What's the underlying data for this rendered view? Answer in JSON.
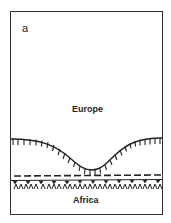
{
  "figure": {
    "panel_label": "a",
    "regions": {
      "upper": "Europe",
      "lower": "Africa"
    },
    "elements": [
      {
        "type": "hatched-curve",
        "description": "ticked boundary curve with downward ticks, dipping in the center"
      },
      {
        "type": "dashed-line",
        "description": "horizontal dashed line"
      },
      {
        "type": "solid-line-with-teeth",
        "description": "horizontal solid line with small downward triangles"
      },
      {
        "type": "chevron-row",
        "description": "row of small inverted-v (lambda) symbols"
      }
    ],
    "colors": {
      "line": "#222222",
      "background": "#ffffff"
    }
  }
}
